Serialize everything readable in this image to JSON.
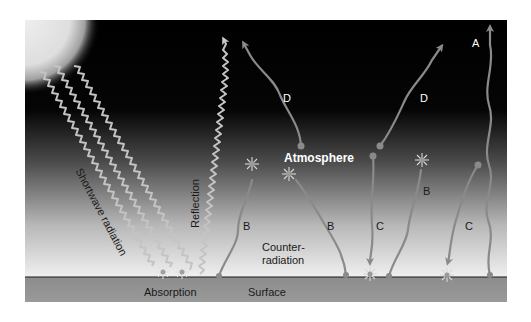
{
  "diagram": {
    "title": "",
    "labels": {
      "shortwave": "Shortwave radiation",
      "reflection": "Reflection",
      "absorption": "Absorption",
      "surface": "Surface",
      "atmosphere": "Atmosphere",
      "counter_line1": "Counter-",
      "counter_line2": "radiation",
      "d_left": "D",
      "d_right": "D",
      "a": "A",
      "b_left": "B",
      "b_mid": "B",
      "b_right": "B",
      "c_mid": "C",
      "c_right": "C"
    },
    "colors": {
      "sky_top": "#000000",
      "sky_bottom": "#f2f2f2",
      "surface": "#8f8f8f",
      "arrow": "#8a8a8a",
      "shortwave": "#bdbdbd",
      "sun": "#e6e6e6"
    }
  }
}
